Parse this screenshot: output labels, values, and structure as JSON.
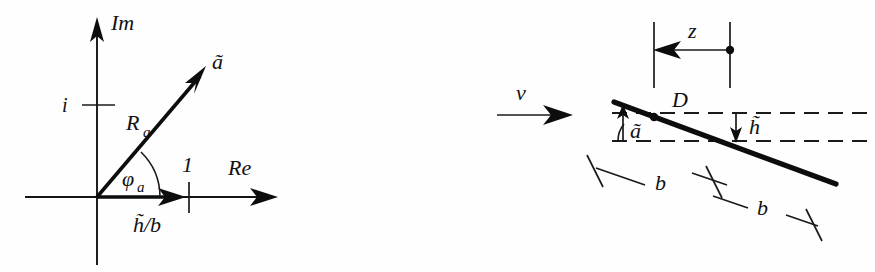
{
  "figure": {
    "background_color": "#fefefe",
    "ink_color": "#0d0d0d"
  },
  "left_panel": {
    "name": "complex-plane-diagram",
    "axes": {
      "imaginary_axis_label": "Im",
      "real_axis_label": "Re"
    },
    "ticks": {
      "imaginary_unit_label": "i",
      "real_unit_label": "1"
    },
    "vector": {
      "label": "ã",
      "magnitude_label": "Ra",
      "magnitude_base": "R",
      "magnitude_sub": "a",
      "angle_label": "φa",
      "angle_base": "φ",
      "angle_sub": "a"
    },
    "projection": {
      "label": "h̃/b"
    }
  },
  "right_panel": {
    "name": "inclined-plate-diagram",
    "flow": {
      "velocity_label": "v"
    },
    "plate": {
      "angle_label": "ã",
      "offset_label": "h̃",
      "point_label": "D",
      "chord_label_1": "b",
      "chord_label_2": "b"
    },
    "coordinate": {
      "label": "z"
    }
  }
}
